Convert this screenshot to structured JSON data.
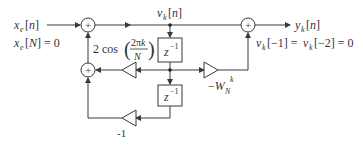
{
  "diagram": {
    "type": "Goertzel second-order filter flow graph",
    "input_label": "x_e[n]",
    "input_condition": "x_e[N] = 0",
    "state_label": "v_k[n]",
    "output_label": "y_k[n]",
    "initial_conditions": "v_k[-1] = v_k[-2] = 0",
    "delay_label": "z^-1",
    "gain_feedback_1": "2cos(2πk/N)",
    "gain_feedback_2": "-1",
    "gain_feedforward": "-W_N^k",
    "adder_symbol": "+",
    "colors": {
      "line": "#3a3a3a",
      "text": "#333333",
      "background": "#ffffff"
    }
  }
}
